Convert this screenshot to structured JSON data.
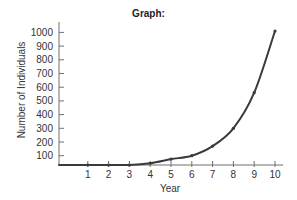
{
  "chart_data": {
    "type": "line",
    "title": "Graph:",
    "xlabel": "Year",
    "ylabel": "Number of Individuals",
    "x": [
      0,
      1,
      2,
      3,
      4,
      5,
      6,
      7,
      8,
      9,
      10
    ],
    "series": [
      {
        "name": "Number of Individuals",
        "values": [
          10,
          10,
          20,
          30,
          45,
          75,
          100,
          170,
          300,
          560,
          1010
        ]
      }
    ],
    "xticks": [
      "1",
      "2",
      "3",
      "4",
      "5",
      "6",
      "7",
      "8",
      "9",
      "10"
    ],
    "yticks": [
      "100",
      "200",
      "300",
      "400",
      "500",
      "600",
      "700",
      "800",
      "900",
      "1000"
    ],
    "xlim": [
      0,
      10
    ],
    "ylim": [
      0,
      1000
    ],
    "grid": false,
    "legend": "none",
    "line_color": "#3a3a3a",
    "axis_color": "#707070"
  }
}
